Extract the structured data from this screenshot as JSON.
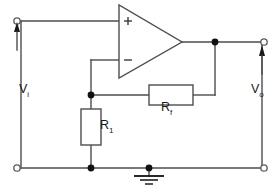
{
  "diagram": {
    "type": "schematic",
    "background_color": "#ffffff",
    "wire_color": "#4d4d4d",
    "node_color": "#111111"
  },
  "labels": {
    "input_voltage": "V",
    "input_voltage_sub": "i",
    "output_voltage": "V",
    "output_voltage_sub": "o",
    "feedback_resistor": "R",
    "feedback_resistor_sub": "f",
    "input_resistor": "R",
    "input_resistor_sub": "1"
  },
  "opamp": {
    "name": "operational-amplifier",
    "noninverting_input_symbol": "+",
    "inverting_input_symbol": "−"
  },
  "components": [
    {
      "id": "opamp",
      "label": "operational amplifier",
      "type": "triangle"
    },
    {
      "id": "rf",
      "label": "R",
      "sub": "f",
      "type": "resistor",
      "orientation": "horizontal"
    },
    {
      "id": "r1",
      "label": "R",
      "sub": "1",
      "type": "resistor",
      "orientation": "vertical"
    },
    {
      "id": "ground",
      "label": "ground",
      "type": "earth-symbol"
    }
  ],
  "terminals": [
    {
      "id": "input-top",
      "label": "V",
      "sub": "i",
      "style": "open-circle"
    },
    {
      "id": "input-bottom",
      "label": "",
      "style": "open-circle"
    },
    {
      "id": "output-top",
      "label": "V",
      "sub": "o",
      "style": "open-circle"
    },
    {
      "id": "output-bottom",
      "label": "",
      "style": "open-circle"
    }
  ],
  "nodes": [
    {
      "id": "inverting-node",
      "x": 91,
      "y": 95
    },
    {
      "id": "output-node",
      "x": 215,
      "y": 42
    },
    {
      "id": "ground-node",
      "x": 91,
      "y": 168
    },
    {
      "id": "ground-tap-node",
      "x": 149,
      "y": 168
    }
  ]
}
